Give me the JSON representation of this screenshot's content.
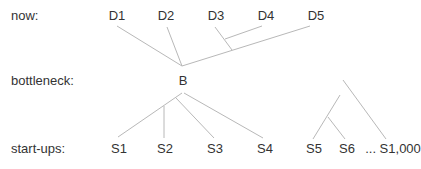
{
  "rows": {
    "now": "now:",
    "bottleneck": "bottleneck:",
    "startups": "start-ups:"
  },
  "nodes": {
    "D1": "D1",
    "D2": "D2",
    "D3": "D3",
    "D4": "D4",
    "D5": "D5",
    "B": "B",
    "S1": "S1",
    "S2": "S2",
    "S3": "S3",
    "S4": "S4",
    "S5": "S5",
    "S6": "S6",
    "S1000": "... S1,000"
  },
  "colors": {
    "text": "#333333",
    "edge": "#b8b8b8"
  }
}
